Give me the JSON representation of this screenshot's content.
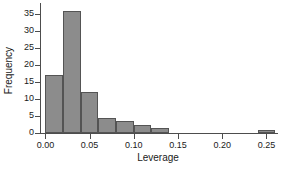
{
  "chart_data": {
    "type": "bar",
    "title": "",
    "xlabel": "Leverage",
    "ylabel": "Frequency",
    "xlim": [
      -0.005,
      0.262
    ],
    "ylim": [
      0,
      38
    ],
    "grid": false,
    "legend": null,
    "bin_width": 0.02,
    "xticks": [
      0.0,
      0.05,
      0.1,
      0.15,
      0.2,
      0.25
    ],
    "xtick_labels": [
      "0.00",
      "0.05",
      "0.10",
      "0.15",
      "0.20",
      "0.25"
    ],
    "yticks": [
      0,
      5,
      10,
      15,
      20,
      25,
      30,
      35
    ],
    "ytick_labels": [
      "0",
      "5",
      "10",
      "15",
      "20",
      "25",
      "30",
      "35"
    ],
    "bar_color": "#8c8c8c",
    "bar_edge_color": "#545454",
    "axis_color": "#4d4d4d",
    "bins": [
      {
        "x0": 0.0,
        "x1": 0.02,
        "value": 17
      },
      {
        "x0": 0.02,
        "x1": 0.04,
        "value": 36
      },
      {
        "x0": 0.04,
        "x1": 0.06,
        "value": 12
      },
      {
        "x0": 0.06,
        "x1": 0.08,
        "value": 4.5
      },
      {
        "x0": 0.08,
        "x1": 0.1,
        "value": 3.5
      },
      {
        "x0": 0.1,
        "x1": 0.12,
        "value": 2.3
      },
      {
        "x0": 0.12,
        "x1": 0.14,
        "value": 1.5
      },
      {
        "x0": 0.14,
        "x1": 0.16,
        "value": 0
      },
      {
        "x0": 0.16,
        "x1": 0.18,
        "value": 0
      },
      {
        "x0": 0.18,
        "x1": 0.2,
        "value": 0
      },
      {
        "x0": 0.2,
        "x1": 0.22,
        "value": 0
      },
      {
        "x0": 0.22,
        "x1": 0.24,
        "value": 0
      },
      {
        "x0": 0.24,
        "x1": 0.26,
        "value": 1
      }
    ],
    "categories": [
      "0.00-0.02",
      "0.02-0.04",
      "0.04-0.06",
      "0.06-0.08",
      "0.08-0.10",
      "0.10-0.12",
      "0.12-0.14",
      "0.14-0.16",
      "0.16-0.18",
      "0.18-0.20",
      "0.20-0.22",
      "0.22-0.24",
      "0.24-0.26"
    ],
    "values": [
      17,
      36,
      12,
      4.5,
      3.5,
      2.3,
      1.5,
      0,
      0,
      0,
      0,
      0,
      1
    ]
  }
}
